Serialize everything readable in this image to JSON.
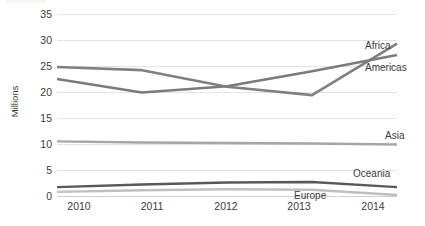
{
  "chart_data": {
    "type": "line",
    "title": "",
    "xlabel": "",
    "ylabel": "Millions",
    "categories": [
      "2010",
      "2011",
      "2012",
      "2013",
      "2014"
    ],
    "x": [
      2010,
      2011,
      2012,
      2013,
      2014
    ],
    "ylim": [
      0,
      35
    ],
    "yticks": [
      0,
      5,
      10,
      15,
      20,
      25,
      30,
      35
    ],
    "grid": true,
    "legend_position": "right-inline-labels",
    "series": [
      {
        "name": "Africa",
        "values": [
          24.8,
          24.2,
          21.0,
          19.4,
          29.3
        ],
        "color": "#808080"
      },
      {
        "name": "Americas",
        "values": [
          22.5,
          19.9,
          21.1,
          24.0,
          27.1
        ],
        "color": "#7b7b7b"
      },
      {
        "name": "Asia",
        "values": [
          10.5,
          10.3,
          10.2,
          10.1,
          9.9
        ],
        "color": "#a6a6a6"
      },
      {
        "name": "Oceania",
        "values": [
          1.7,
          2.2,
          2.6,
          2.7,
          1.7
        ],
        "color": "#595959"
      },
      {
        "name": "Europe",
        "values": [
          0.8,
          1.1,
          1.3,
          1.2,
          0.2
        ],
        "color": "#bfbfbf"
      }
    ]
  },
  "axis": {
    "y_title": "Millions",
    "y_tick_labels": [
      "35",
      "30",
      "25",
      "20",
      "15",
      "10",
      "5",
      "0"
    ],
    "x_tick_labels": [
      "2010",
      "2011",
      "2012",
      "2013",
      "2014"
    ]
  },
  "series_labels": [
    {
      "text": "Africa"
    },
    {
      "text": "Americas"
    },
    {
      "text": "Asia"
    },
    {
      "text": "Oceania"
    },
    {
      "text": "Europe"
    }
  ],
  "colors": {
    "gridline": "#e3e3e3",
    "text": "#3b3b3b",
    "background": "#ffffff"
  }
}
